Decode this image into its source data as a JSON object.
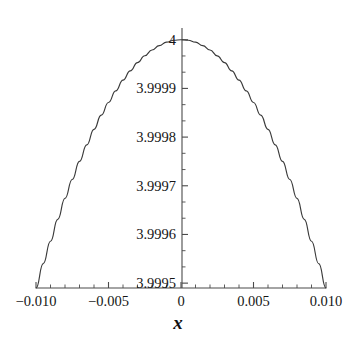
{
  "chart_data": {
    "type": "line",
    "title": "",
    "subtitle": "",
    "xlabel": "x",
    "ylabel": "",
    "grid": false,
    "legend": false,
    "legend_position": "none",
    "xlim": [
      -0.01,
      0.01
    ],
    "ylim": [
      3.99949,
      4.00002
    ],
    "x_ticks": [
      -0.01,
      -0.005,
      0,
      0.005,
      0.01
    ],
    "x_tick_labels": [
      "−0.010",
      "−0.005",
      "0",
      "0.005",
      "0.010"
    ],
    "x_minor_ticks_per_interval": 4,
    "y_ticks": [
      3.9995,
      3.9996,
      3.9997,
      3.9998,
      3.9999,
      4
    ],
    "y_tick_labels": [
      "3.9995",
      "3.9996",
      "3.9997",
      "3.9998",
      "3.9999",
      "4"
    ],
    "y_minor_ticks_per_interval": 2,
    "series": [
      {
        "name": "curve",
        "color": "#3a3a3a",
        "x": [
          -0.01,
          -0.0095,
          -0.009,
          -0.0085,
          -0.008,
          -0.0075,
          -0.007,
          -0.0065,
          -0.006,
          -0.0055,
          -0.005,
          -0.0045,
          -0.004,
          -0.0035,
          -0.003,
          -0.0025,
          -0.002,
          -0.0015,
          -0.001,
          -0.0005,
          0.0,
          0.0005,
          0.001,
          0.0015,
          0.002,
          0.0025,
          0.003,
          0.0035,
          0.004,
          0.0045,
          0.005,
          0.0055,
          0.006,
          0.0065,
          0.007,
          0.0075,
          0.008,
          0.0085,
          0.009,
          0.0095,
          0.01
        ],
        "y": [
          3.99949,
          3.99954,
          3.999586,
          3.999631,
          3.999674,
          3.999713,
          3.99975,
          3.999784,
          3.999816,
          3.999845,
          3.999871,
          3.999895,
          3.999917,
          3.999936,
          3.999953,
          3.999967,
          3.999979,
          3.999988,
          3.999995,
          3.999999,
          4.0,
          3.999999,
          3.999995,
          3.999988,
          3.999979,
          3.999967,
          3.999953,
          3.999936,
          3.999917,
          3.999895,
          3.999871,
          3.999845,
          3.999816,
          3.999784,
          3.99975,
          3.999713,
          3.999674,
          3.999631,
          3.999586,
          3.99954,
          3.99949
        ]
      }
    ],
    "annotations": [],
    "peak_point": {
      "x": 0,
      "y": 4
    },
    "axis_style": "maple-style crossing axes, y-axis at x=0, ticks outward"
  },
  "axes": {
    "x_title": "x",
    "x_tick_labels": [
      "−0.010",
      "−0.005",
      "0",
      "0.005",
      "0.010"
    ],
    "y_tick_labels": [
      "3.9995",
      "3.9996",
      "3.9997",
      "3.9998",
      "3.9999",
      "4"
    ]
  },
  "colors": {
    "background": "#ffffff",
    "axis": "#4a4a4a",
    "curve": "#3a3a3a",
    "text": "#151515"
  }
}
